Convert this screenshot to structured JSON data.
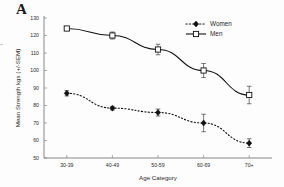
{
  "panel": {
    "label": "A"
  },
  "chart_data": {
    "type": "line",
    "title": "",
    "xlabel": "Age Category",
    "ylabel": "Mean Strength kgs (+/-SEM)",
    "categories": [
      "30-39",
      "40-49",
      "50-59",
      "60-69",
      "70+"
    ],
    "ylim": [
      50,
      130
    ],
    "yticks": [
      50,
      60,
      70,
      80,
      90,
      100,
      110,
      120,
      130
    ],
    "ytick_labels": [
      "50",
      "60",
      "70",
      "80",
      "90",
      "100",
      "110",
      "120",
      "130"
    ],
    "grid": false,
    "legend_position": "top-right",
    "series": [
      {
        "name": "Women",
        "marker": "filled-diamond",
        "line_style": "dotted",
        "values": [
          87,
          78.5,
          76,
          70,
          58.5
        ],
        "errors": [
          1.5,
          1.0,
          2.0,
          5.0,
          2.5
        ]
      },
      {
        "name": "Men",
        "marker": "open-square",
        "line_style": "solid",
        "values": [
          124,
          120,
          112,
          100,
          86
        ],
        "errors": [
          1.0,
          2.0,
          3.0,
          4.0,
          5.0
        ]
      }
    ]
  },
  "colors": {
    "series_line": "#111111",
    "axis": "#555555",
    "text": "#2a2a2a",
    "background": "#fdfdfd"
  }
}
